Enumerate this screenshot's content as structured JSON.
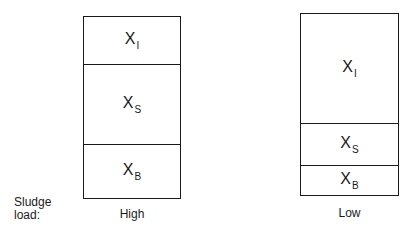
{
  "side_label": {
    "line1": "Sludge",
    "line2": "load:"
  },
  "columns": [
    {
      "caption": "High",
      "segments": [
        {
          "symbol": "X",
          "sub": "I",
          "height_px": 47
        },
        {
          "symbol": "X",
          "sub": "S",
          "height_px": 80
        },
        {
          "symbol": "X",
          "sub": "B",
          "height_px": 56
        }
      ]
    },
    {
      "caption": "Low",
      "segments": [
        {
          "symbol": "X",
          "sub": "I",
          "height_px": 109
        },
        {
          "symbol": "X",
          "sub": "S",
          "height_px": 42
        },
        {
          "symbol": "X",
          "sub": "B",
          "height_px": 32
        }
      ]
    }
  ]
}
